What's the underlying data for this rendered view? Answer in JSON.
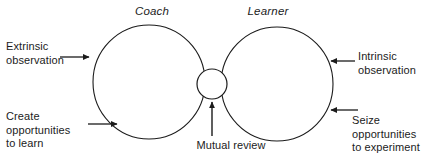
{
  "diagram": {
    "title_visible": false,
    "stroke_color": "#1b1b1b",
    "text_color": "#1b1b1b",
    "background_color": "#ffffff",
    "roles": {
      "left_label": "Coach",
      "right_label": "Learner"
    },
    "annotations": {
      "left_top": "Extrinsic\nobservation",
      "left_bottom": "Create\nopportunities\nto learn",
      "right_top": "Intrinsic\nobservation",
      "right_bottom": "Seize\nopportunities\nto experiment",
      "center_bottom": "Mutual review"
    },
    "arrows": [
      {
        "name": "extrinsic-observation-arrow",
        "direction": "right",
        "target": "coach-circle"
      },
      {
        "name": "create-opportunities-arrow",
        "direction": "right",
        "target": "coach-circle"
      },
      {
        "name": "intrinsic-observation-arrow",
        "direction": "left",
        "target": "learner-circle"
      },
      {
        "name": "seize-opportunities-arrow",
        "direction": "left",
        "target": "learner-circle"
      },
      {
        "name": "mutual-review-arrow",
        "direction": "up",
        "target": "mutual-review-circle"
      }
    ],
    "shapes": [
      {
        "name": "coach-circle",
        "type": "ellipse",
        "cx": 149,
        "cy": 82,
        "rx": 56,
        "ry": 57
      },
      {
        "name": "learner-circle",
        "type": "ellipse",
        "cx": 277,
        "cy": 84,
        "rx": 56,
        "ry": 57
      },
      {
        "name": "mutual-review-circle",
        "type": "ellipse",
        "cx": 212,
        "cy": 84,
        "rx": 15,
        "ry": 15
      }
    ]
  }
}
